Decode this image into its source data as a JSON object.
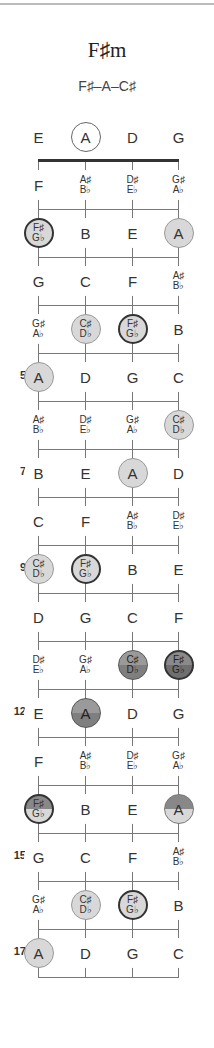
{
  "title": "F♯m",
  "subtitle": "F♯–A–C♯",
  "strings": [
    "E",
    "A",
    "D",
    "G"
  ],
  "layout": {
    "string_x": [
      38,
      85,
      132,
      178
    ],
    "open_y": 137,
    "nut_y": 160,
    "fret_spacing": 48,
    "num_frets": 17
  },
  "rows": [
    {
      "fret": 0,
      "label": "",
      "notes": [
        {
          "t": [
            "E"
          ],
          "s": "plain"
        },
        {
          "t": [
            "A"
          ],
          "s": "ring"
        },
        {
          "t": [
            "D"
          ],
          "s": "plain"
        },
        {
          "t": [
            "G"
          ],
          "s": "plain"
        }
      ]
    },
    {
      "fret": 1,
      "label": "",
      "notes": [
        {
          "t": [
            "F"
          ],
          "s": "plain"
        },
        {
          "t": [
            "A♯",
            "B♭"
          ],
          "s": "plain"
        },
        {
          "t": [
            "D♯",
            "E♭"
          ],
          "s": "plain"
        },
        {
          "t": [
            "G♯",
            "A♭"
          ],
          "s": "plain"
        }
      ]
    },
    {
      "fret": 2,
      "label": "",
      "notes": [
        {
          "t": [
            "F♯",
            "G♭"
          ],
          "s": "dark-ring"
        },
        {
          "t": [
            "B"
          ],
          "s": "plain"
        },
        {
          "t": [
            "E"
          ],
          "s": "plain"
        },
        {
          "t": [
            "A"
          ],
          "s": "light"
        }
      ]
    },
    {
      "fret": 3,
      "label": "",
      "notes": [
        {
          "t": [
            "G"
          ],
          "s": "plain"
        },
        {
          "t": [
            "C"
          ],
          "s": "plain"
        },
        {
          "t": [
            "F"
          ],
          "s": "plain"
        },
        {
          "t": [
            "A♯",
            "B♭"
          ],
          "s": "plain"
        }
      ]
    },
    {
      "fret": 4,
      "label": "",
      "notes": [
        {
          "t": [
            "G♯",
            "A♭"
          ],
          "s": "plain"
        },
        {
          "t": [
            "C♯",
            "D♭"
          ],
          "s": "light"
        },
        {
          "t": [
            "F♯",
            "G♭"
          ],
          "s": "dark-ring"
        },
        {
          "t": [
            "B"
          ],
          "s": "plain"
        }
      ]
    },
    {
      "fret": 5,
      "label": "5",
      "notes": [
        {
          "t": [
            "A"
          ],
          "s": "light"
        },
        {
          "t": [
            "D"
          ],
          "s": "plain"
        },
        {
          "t": [
            "G"
          ],
          "s": "plain"
        },
        {
          "t": [
            "C"
          ],
          "s": "plain"
        }
      ]
    },
    {
      "fret": 6,
      "label": "",
      "notes": [
        {
          "t": [
            "A♯",
            "B♭"
          ],
          "s": "plain"
        },
        {
          "t": [
            "D♯",
            "E♭"
          ],
          "s": "plain"
        },
        {
          "t": [
            "G♯",
            "A♭"
          ],
          "s": "plain"
        },
        {
          "t": [
            "C♯",
            "D♭"
          ],
          "s": "light"
        }
      ]
    },
    {
      "fret": 7,
      "label": "7",
      "notes": [
        {
          "t": [
            "B"
          ],
          "s": "plain"
        },
        {
          "t": [
            "E"
          ],
          "s": "plain"
        },
        {
          "t": [
            "A"
          ],
          "s": "light"
        },
        {
          "t": [
            "D"
          ],
          "s": "plain"
        }
      ]
    },
    {
      "fret": 8,
      "label": "",
      "notes": [
        {
          "t": [
            "C"
          ],
          "s": "plain"
        },
        {
          "t": [
            "F"
          ],
          "s": "plain"
        },
        {
          "t": [
            "A♯",
            "B♭"
          ],
          "s": "plain"
        },
        {
          "t": [
            "D♯",
            "E♭"
          ],
          "s": "plain"
        }
      ]
    },
    {
      "fret": 9,
      "label": "9",
      "notes": [
        {
          "t": [
            "C♯",
            "D♭"
          ],
          "s": "light"
        },
        {
          "t": [
            "F♯",
            "G♭"
          ],
          "s": "dark-ring"
        },
        {
          "t": [
            "B"
          ],
          "s": "plain"
        },
        {
          "t": [
            "E"
          ],
          "s": "plain"
        }
      ]
    },
    {
      "fret": 10,
      "label": "",
      "notes": [
        {
          "t": [
            "D"
          ],
          "s": "plain"
        },
        {
          "t": [
            "G"
          ],
          "s": "plain"
        },
        {
          "t": [
            "C"
          ],
          "s": "plain"
        },
        {
          "t": [
            "F"
          ],
          "s": "plain"
        }
      ]
    },
    {
      "fret": 11,
      "label": "",
      "notes": [
        {
          "t": [
            "D♯",
            "E♭"
          ],
          "s": "plain"
        },
        {
          "t": [
            "G♯",
            "A♭"
          ],
          "s": "plain"
        },
        {
          "t": [
            "C♯",
            "D♭"
          ],
          "s": "mid"
        },
        {
          "t": [
            "F♯",
            "G♭"
          ],
          "s": "dark-mid"
        }
      ]
    },
    {
      "fret": 12,
      "label": "12",
      "notes": [
        {
          "t": [
            "E"
          ],
          "s": "plain"
        },
        {
          "t": [
            "A"
          ],
          "s": "mid"
        },
        {
          "t": [
            "D"
          ],
          "s": "plain"
        },
        {
          "t": [
            "G"
          ],
          "s": "plain"
        }
      ]
    },
    {
      "fret": 13,
      "label": "",
      "notes": [
        {
          "t": [
            "F"
          ],
          "s": "plain"
        },
        {
          "t": [
            "A♯",
            "B♭"
          ],
          "s": "plain"
        },
        {
          "t": [
            "D♯",
            "E♭"
          ],
          "s": "plain"
        },
        {
          "t": [
            "G♯",
            "A♭"
          ],
          "s": "plain"
        }
      ]
    },
    {
      "fret": 14,
      "label": "",
      "notes": [
        {
          "t": [
            "F♯",
            "G♭"
          ],
          "s": "half-top-dark"
        },
        {
          "t": [
            "B"
          ],
          "s": "plain"
        },
        {
          "t": [
            "E"
          ],
          "s": "plain"
        },
        {
          "t": [
            "A"
          ],
          "s": "half-top"
        }
      ]
    },
    {
      "fret": 15,
      "label": "15",
      "notes": [
        {
          "t": [
            "G"
          ],
          "s": "plain"
        },
        {
          "t": [
            "C"
          ],
          "s": "plain"
        },
        {
          "t": [
            "F"
          ],
          "s": "plain"
        },
        {
          "t": [
            "A♯",
            "B♭"
          ],
          "s": "plain"
        }
      ]
    },
    {
      "fret": 16,
      "label": "",
      "notes": [
        {
          "t": [
            "G♯",
            "A♭"
          ],
          "s": "plain"
        },
        {
          "t": [
            "C♯",
            "D♭"
          ],
          "s": "light"
        },
        {
          "t": [
            "F♯",
            "G♭"
          ],
          "s": "dark-ring"
        },
        {
          "t": [
            "B"
          ],
          "s": "plain"
        }
      ]
    },
    {
      "fret": 17,
      "label": "17",
      "notes": [
        {
          "t": [
            "A"
          ],
          "s": "light"
        },
        {
          "t": [
            "D"
          ],
          "s": "plain"
        },
        {
          "t": [
            "G"
          ],
          "s": "plain"
        },
        {
          "t": [
            "C"
          ],
          "s": "plain"
        }
      ]
    }
  ]
}
